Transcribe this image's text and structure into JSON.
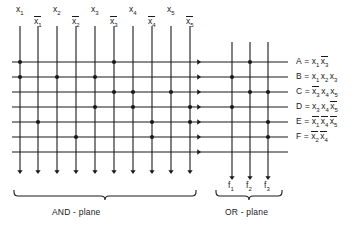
{
  "diagram": {
    "line_color": "#1a1a1a",
    "background": "#ffffff"
  },
  "inputs": {
    "columns": [
      {
        "id": "x1",
        "base": "x",
        "sub": "1",
        "bar": false,
        "x": 20
      },
      {
        "id": "x1b",
        "base": "x",
        "sub": "1",
        "bar": true,
        "x": 38
      },
      {
        "id": "x2",
        "base": "x",
        "sub": "2",
        "bar": false,
        "x": 57
      },
      {
        "id": "x2b",
        "base": "x",
        "sub": "2",
        "bar": true,
        "x": 76
      },
      {
        "id": "x3",
        "base": "x",
        "sub": "3",
        "bar": false,
        "x": 95
      },
      {
        "id": "x3b",
        "base": "x",
        "sub": "3",
        "bar": true,
        "x": 114
      },
      {
        "id": "x4",
        "base": "x",
        "sub": "4",
        "bar": false,
        "x": 133
      },
      {
        "id": "x4b",
        "base": "x",
        "sub": "4",
        "bar": true,
        "x": 152
      },
      {
        "id": "x5",
        "base": "x",
        "sub": "5",
        "bar": false,
        "x": 171
      },
      {
        "id": "x5b",
        "base": "x",
        "sub": "5",
        "bar": true,
        "x": 190
      }
    ]
  },
  "product_lines": {
    "rows": [
      {
        "id": "A",
        "y": 62
      },
      {
        "id": "B",
        "y": 77
      },
      {
        "id": "C",
        "y": 92
      },
      {
        "id": "D",
        "y": 107
      },
      {
        "id": "E",
        "y": 122
      },
      {
        "id": "F",
        "y": 137
      },
      {
        "id": "G",
        "y": 152
      }
    ]
  },
  "and_plane": {
    "label": "AND - plane",
    "connections": [
      {
        "row": "A",
        "cols": [
          "x1",
          "x3b"
        ]
      },
      {
        "row": "B",
        "cols": [
          "x1",
          "x2",
          "x3"
        ]
      },
      {
        "row": "C",
        "cols": [
          "x3b",
          "x4",
          "x5"
        ]
      },
      {
        "row": "D",
        "cols": [
          "x3",
          "x4",
          "x5b"
        ]
      },
      {
        "row": "E",
        "cols": [
          "x1b",
          "x4b",
          "x5b"
        ]
      },
      {
        "row": "F",
        "cols": [
          "x2b",
          "x4b"
        ]
      }
    ]
  },
  "or_plane": {
    "label": "OR - plane",
    "columns": [
      {
        "id": "f1",
        "base": "f",
        "sub": "1",
        "x": 232
      },
      {
        "id": "f2",
        "base": "f",
        "sub": "2",
        "x": 250
      },
      {
        "id": "f3",
        "base": "f",
        "sub": "3",
        "x": 268
      }
    ],
    "connections": [
      {
        "row": "A",
        "cols": [
          "f2"
        ]
      },
      {
        "row": "B",
        "cols": [
          "f1"
        ]
      },
      {
        "row": "C",
        "cols": [
          "f2",
          "f3"
        ]
      },
      {
        "row": "D",
        "cols": [
          "f1"
        ]
      },
      {
        "row": "E",
        "cols": [
          "f3"
        ]
      },
      {
        "row": "F",
        "cols": [
          "f3"
        ]
      }
    ]
  },
  "equations": [
    {
      "name": "A",
      "y": 62,
      "terms": [
        {
          "base": "x",
          "sub": "1",
          "bar": false
        },
        {
          "base": "x",
          "sub": "3",
          "bar": true
        }
      ]
    },
    {
      "name": "B",
      "y": 77,
      "terms": [
        {
          "base": "x",
          "sub": "1",
          "bar": false
        },
        {
          "base": "x",
          "sub": "2",
          "bar": false
        },
        {
          "base": "x",
          "sub": "3",
          "bar": false
        }
      ]
    },
    {
      "name": "C",
      "y": 92,
      "terms": [
        {
          "base": "x",
          "sub": "3",
          "bar": true
        },
        {
          "base": "x",
          "sub": "4",
          "bar": false
        },
        {
          "base": "x",
          "sub": "5",
          "bar": false
        }
      ]
    },
    {
      "name": "D",
      "y": 107,
      "terms": [
        {
          "base": "x",
          "sub": "3",
          "bar": false
        },
        {
          "base": "x",
          "sub": "4",
          "bar": false
        },
        {
          "base": "x",
          "sub": "5",
          "bar": true
        }
      ]
    },
    {
      "name": "E",
      "y": 122,
      "terms": [
        {
          "base": "x",
          "sub": "1",
          "bar": true
        },
        {
          "base": "x",
          "sub": "4",
          "bar": true
        },
        {
          "base": "x",
          "sub": "5",
          "bar": true
        }
      ]
    },
    {
      "name": "F",
      "y": 137,
      "terms": [
        {
          "base": "x",
          "sub": "2",
          "bar": true
        },
        {
          "base": "x",
          "sub": "4",
          "bar": true
        }
      ]
    }
  ],
  "equals_sign": "="
}
